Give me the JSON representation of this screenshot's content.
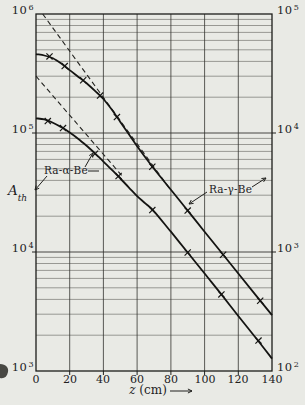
{
  "figure_bg": "#e9eae5",
  "ink": "#21211e",
  "axes": {
    "pow_base": "10",
    "left_exponents": [
      "6",
      "5",
      "4",
      "3"
    ],
    "right_exponents": [
      "5",
      "4",
      "3",
      "2"
    ],
    "x_tick_labels": [
      "0",
      "20",
      "40",
      "60",
      "80",
      "100",
      "120",
      "140"
    ],
    "y_axis_letter": "A",
    "y_axis_sub": "th",
    "x_axis_title": "z (cm)"
  },
  "labels": {
    "curve_alpha": "Ra-α-Be",
    "curve_gamma": "Ra-γ-Be"
  },
  "chart_data": {
    "type": "line",
    "y_scale": "log",
    "x_label": "z (cm)",
    "y_label": "A_th (thermal activation)",
    "x_range": [
      0,
      140
    ],
    "x_ticks": [
      0,
      20,
      40,
      60,
      80,
      100,
      120,
      140
    ],
    "left_axis_range": [
      1000,
      1000000
    ],
    "right_axis_range": [
      100,
      100000
    ],
    "grid": "log minor gridlines 2-9 each decade; vertical gridlines every 20 cm",
    "note": "Ra-α-Be curve is read on the left scale (A_th 10^3..10^6); Ra-γ-Be curve is read on the right scale (10^2..10^5, one decade lower). Point values below are in left-scale units as plotted.",
    "series": [
      {
        "name": "Ra-γ-Be",
        "axis": "right",
        "style": "solid",
        "marker": "x",
        "points": [
          [
            0,
            460000
          ],
          [
            5,
            448000
          ],
          [
            10,
            425000
          ],
          [
            15,
            383000
          ],
          [
            20,
            338000
          ],
          [
            25,
            297000
          ],
          [
            30,
            262000
          ],
          [
            35,
            226000
          ],
          [
            40,
            193000
          ],
          [
            45,
            157000
          ],
          [
            50,
            124000
          ],
          [
            55,
            98000
          ],
          [
            60,
            77500
          ],
          [
            65,
            62000
          ],
          [
            70,
            50000
          ],
          [
            80,
            33400
          ],
          [
            90,
            22300
          ],
          [
            100,
            14800
          ],
          [
            110,
            9900
          ],
          [
            120,
            6600
          ],
          [
            130,
            4400
          ],
          [
            140,
            2950
          ]
        ],
        "markers": [
          [
            8,
            440000
          ],
          [
            17,
            365000
          ],
          [
            28,
            278000
          ],
          [
            38,
            206000
          ],
          [
            48,
            136000
          ],
          [
            69,
            52000
          ],
          [
            90,
            22300
          ],
          [
            111,
            9500
          ],
          [
            133,
            3900
          ]
        ]
      },
      {
        "name": "Ra-α-Be",
        "axis": "left",
        "style": "solid",
        "marker": "x",
        "points": [
          [
            0,
            133000
          ],
          [
            5,
            130000
          ],
          [
            10,
            122000
          ],
          [
            15,
            112000
          ],
          [
            20,
            101000
          ],
          [
            25,
            89500
          ],
          [
            30,
            78000
          ],
          [
            35,
            67500
          ],
          [
            40,
            57500
          ],
          [
            45,
            49000
          ],
          [
            50,
            41500
          ],
          [
            55,
            35000
          ],
          [
            60,
            29500
          ],
          [
            65,
            25500
          ],
          [
            70,
            22000
          ],
          [
            80,
            14800
          ],
          [
            90,
            9900
          ],
          [
            100,
            6600
          ],
          [
            110,
            4400
          ],
          [
            120,
            2900
          ],
          [
            130,
            1930
          ],
          [
            140,
            1270
          ]
        ],
        "markers": [
          [
            7,
            126000
          ],
          [
            16,
            110000
          ],
          [
            35,
            67000
          ],
          [
            49,
            43500
          ],
          [
            69,
            22500
          ],
          [
            90,
            9900
          ],
          [
            110,
            4400
          ],
          [
            132,
            1800
          ]
        ]
      },
      {
        "name": "Ra-γ-Be exponential asymptote",
        "axis": "right",
        "style": "dashed",
        "points": [
          [
            4,
            1000000
          ],
          [
            80,
            33000
          ]
        ]
      },
      {
        "name": "Ra-α-Be exponential asymptote",
        "axis": "left",
        "style": "dashed",
        "points": [
          [
            0,
            300000
          ],
          [
            52,
            42000
          ]
        ]
      }
    ]
  }
}
